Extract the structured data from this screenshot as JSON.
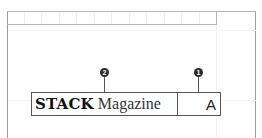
{
  "diagram": {
    "ruler": {
      "cells": 12
    },
    "field_box": {
      "brand_text": "STACK",
      "title_text": "Magazine",
      "right_text": "A"
    },
    "callouts": [
      {
        "id": "callout-1",
        "label": "1",
        "points_to": "right-cell"
      },
      {
        "id": "callout-2",
        "label": "2",
        "points_to": "left-cell"
      }
    ],
    "colors": {
      "border": "#555555",
      "frame": "#9a9a9a",
      "callout_fill": "#2a2a2a",
      "callout_text": "#ffffff"
    }
  }
}
